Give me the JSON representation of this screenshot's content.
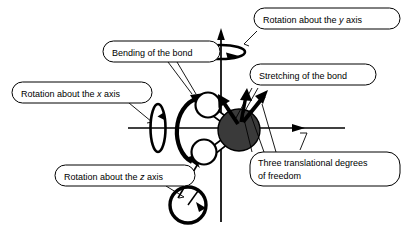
{
  "diagram": {
    "type": "molecular-degrees-of-freedom",
    "background_color": "#ffffff",
    "line_color": "#000000",
    "central_atom_color": "#3a3a3a",
    "outer_atom_color": "#ffffff"
  },
  "callouts": [
    {
      "id": "rotation-y",
      "line1": "Rotation about the ",
      "italic": "y",
      "line1_tail": " axis",
      "line2": ""
    },
    {
      "id": "bending",
      "line1": "Bending of the bond",
      "italic": "",
      "line1_tail": "",
      "line2": ""
    },
    {
      "id": "stretching",
      "line1": "Stretching of the bond",
      "italic": "",
      "line1_tail": "",
      "line2": ""
    },
    {
      "id": "rotation-x",
      "line1": "Rotation about the ",
      "italic": "x",
      "line1_tail": " axis",
      "line2": ""
    },
    {
      "id": "translational",
      "line1": "Three translational degrees",
      "italic": "",
      "line1_tail": "",
      "line2": "of freedom"
    },
    {
      "id": "rotation-z",
      "line1": "Rotation about the ",
      "italic": "z",
      "line1_tail": " axis",
      "line2": ""
    }
  ],
  "labels": {
    "rotation_y": "Rotation about the y axis",
    "bending": "Bending of the bond",
    "stretching": "Stretching of the bond",
    "rotation_x": "Rotation about the x axis",
    "translational_l1": "Three translational degrees",
    "translational_l2": "of freedom",
    "rotation_z": "Rotation about the z axis"
  },
  "axes": {
    "y_axis": "vertical",
    "x_axis": "horizontal",
    "z_axis": "out-of-plane"
  }
}
